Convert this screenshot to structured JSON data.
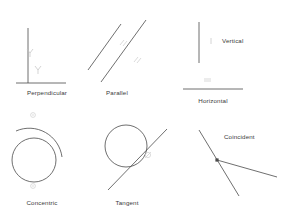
{
  "diagram": {
    "background_color": "#ffffff",
    "stroke_color": "#4a4a4a",
    "glyph_color": "#c9c9c9",
    "label_color": "#3a3a3a",
    "width": 286,
    "height": 212
  },
  "items": [
    {
      "id": "perpendicular",
      "label": "Perpendicular",
      "glyph_name": "perpendicular-constraint-glyph",
      "glyph_count": 2,
      "description": "A vertical line meeting a horizontal line at a right angle",
      "label_x": 47,
      "label_y": 90
    },
    {
      "id": "parallel",
      "label": "Parallel",
      "glyph_name": "parallel-constraint-glyph",
      "glyph_count": 2,
      "description": "Two diagonal lines running in the same direction",
      "label_x": 117,
      "label_y": 90
    },
    {
      "id": "vertical",
      "label": "Vertical",
      "glyph_name": "vertical-constraint-glyph",
      "glyph_count": 1,
      "description": "A single upright line",
      "label_x": 238,
      "label_y": 38
    },
    {
      "id": "horizontal",
      "label": "Horizontal",
      "glyph_name": "horizontal-constraint-glyph",
      "glyph_count": 1,
      "description": "A single level line",
      "label_x": 213,
      "label_y": 98
    },
    {
      "id": "concentric",
      "label": "Concentric",
      "glyph_name": "concentric-constraint-glyph",
      "glyph_count": 2,
      "description": "An inner circle and an outer arc sharing a center",
      "label_x": 42,
      "label_y": 200
    },
    {
      "id": "tangent",
      "label": "Tangent",
      "glyph_name": "tangent-constraint-glyph",
      "glyph_count": 1,
      "description": "A line touching a circle at one point",
      "label_x": 127,
      "label_y": 200
    },
    {
      "id": "coincident",
      "label": "Coincident",
      "glyph_name": "coincident-point-marker",
      "glyph_count": 1,
      "description": "Two lines meeting at a shared point",
      "label_x": 244,
      "label_y": 138
    }
  ]
}
